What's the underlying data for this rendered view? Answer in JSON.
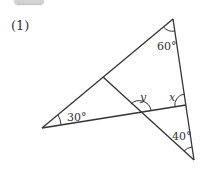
{
  "header": {
    "tab_label": ""
  },
  "problem": {
    "number": "(1)"
  },
  "figure": {
    "type": "geometry-triangle",
    "angles": {
      "top": "60°",
      "left": "30°",
      "bottom": "40°",
      "unknown_1": "y",
      "unknown_2": "x"
    },
    "line_color": "#333333"
  }
}
